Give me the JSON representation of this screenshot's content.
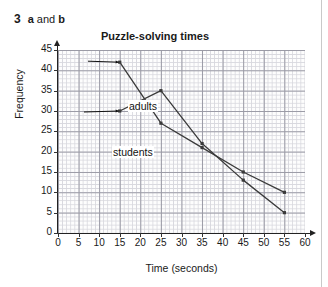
{
  "question": {
    "number": "3",
    "part_a": "a",
    "conjunction": " and ",
    "part_b": "b"
  },
  "chart_data": {
    "type": "line",
    "title": "Puzzle-solving times",
    "xlabel": "Time (seconds)",
    "ylabel": "Frequency",
    "xlim": [
      0,
      60
    ],
    "ylim": [
      0,
      45
    ],
    "xticks": [
      "0",
      "5",
      "10",
      "15",
      "20",
      "25",
      "30",
      "35",
      "40",
      "45",
      "50",
      "55",
      "60"
    ],
    "yticks": [
      "0",
      "5",
      "10",
      "15",
      "20",
      "25",
      "30",
      "35",
      "40",
      "45"
    ],
    "grid": true,
    "grid_minor_step": 1,
    "grid_major_step": 5,
    "legend_position": "inline-annotations",
    "x": [
      15,
      25,
      35,
      45,
      55
    ],
    "series": [
      {
        "name": "adults",
        "label": "adults",
        "values": [
          42,
          27,
          21,
          15,
          10
        ],
        "color": "#3a3a3a"
      },
      {
        "name": "students",
        "label": "students",
        "values": [
          30,
          35,
          22,
          13,
          5
        ],
        "color": "#3a3a3a"
      }
    ],
    "annotations": [
      {
        "name": "adults",
        "text": "adults",
        "points_to_x": 15,
        "points_to_y": 42
      },
      {
        "name": "students",
        "text": "students",
        "points_to_x": 15,
        "points_to_y": 30
      }
    ]
  }
}
